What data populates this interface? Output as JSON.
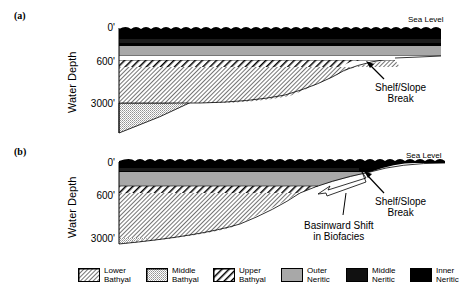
{
  "panels": [
    {
      "label": "(a)",
      "sea_level": "Sea Level",
      "y_axis_label": "Water Depth",
      "ticks": [
        "0'",
        "600'",
        "3000'"
      ],
      "annotations": [
        {
          "text": "Shelf/Slope Break"
        }
      ]
    },
    {
      "label": "(b)",
      "sea_level": "Sea Level",
      "y_axis_label": "Water Depth",
      "ticks": [
        "0'",
        "600'",
        "3000'"
      ],
      "annotations": [
        {
          "text": "Shelf/Slope Break"
        },
        {
          "text": "Basinward Shift in Biofacies"
        }
      ]
    }
  ],
  "legend": [
    {
      "line1": "Lower",
      "line2": "Bathyal",
      "pattern": "diagonal-hatch-fine"
    },
    {
      "line1": "Middle",
      "line2": "Bathyal",
      "pattern": "stipple"
    },
    {
      "line1": "Upper",
      "line2": "Bathyal",
      "pattern": "bold-hatch"
    },
    {
      "line1": "Outer",
      "line2": "Neritic",
      "pattern": "gray",
      "color": "#a8a8a8"
    },
    {
      "line1": "Middle",
      "line2": "Neritic",
      "pattern": "black",
      "color": "#111111"
    },
    {
      "line1": "Inner",
      "line2": "Neritic",
      "pattern": "black",
      "color": "#000000"
    }
  ],
  "annotation_lines": {
    "shelf_break_a_l1": "Shelf/Slope",
    "shelf_break_a_l2": "Break",
    "shelf_break_b_l1": "Shelf/Slope",
    "shelf_break_b_l2": "Break",
    "basinward_l1": "Basinward Shift",
    "basinward_l2": "in Biofacies"
  }
}
